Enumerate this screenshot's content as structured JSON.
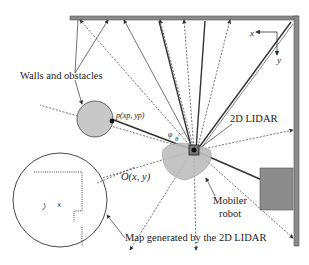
{
  "labels": {
    "walls": "Walls and obstacles",
    "point": "p(xp, yp)",
    "lidar": "2D LIDAR",
    "origin": "O(x, y)",
    "robot_line1": "Mobiler",
    "robot_line2": "robot",
    "map": "Map generated by the 2D LIDAR",
    "axis_x": "x",
    "axis_y": "y",
    "angle_phi": "φ",
    "angle_theta": "θ"
  },
  "colors": {
    "wall": "#8a8a8a",
    "wall_border": "#5a5a5a",
    "obstacle_circle": "#c8c8c8",
    "obstacle_box": "#8c8c8c",
    "beam": "#333333",
    "robot_fill": "#b8b8b8"
  }
}
